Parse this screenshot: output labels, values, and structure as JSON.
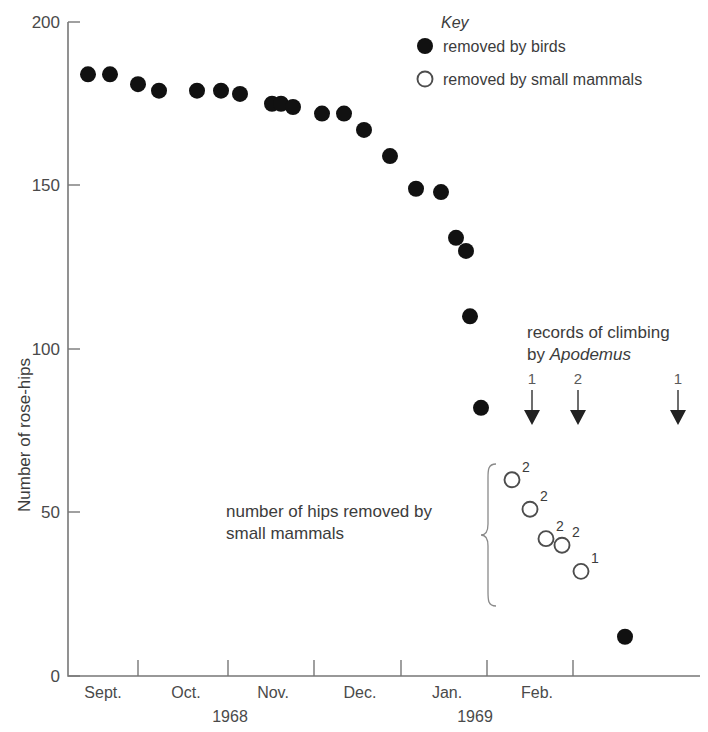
{
  "chart_data": {
    "type": "scatter",
    "title": "",
    "xlabel": "",
    "ylabel": "Number of rose-hips",
    "ylim": [
      0,
      200
    ],
    "yticks": [
      0,
      50,
      100,
      150,
      200
    ],
    "ytick_labels": [
      "0",
      "50",
      "100",
      "150",
      "200"
    ],
    "grid": false,
    "xtick_month_labels": [
      "Sept.",
      "Oct.",
      "Nov.",
      "Dec.",
      "Jan.",
      "Feb."
    ],
    "x_year_labels": [
      "1968",
      "1969"
    ],
    "legend_position": "top-right",
    "series": [
      {
        "name": "removed by birds",
        "marker": "filled-circle",
        "color": "#111111",
        "points": [
          {
            "x_px": 88,
            "value": 184
          },
          {
            "x_px": 110,
            "value": 184
          },
          {
            "x_px": 138,
            "value": 181
          },
          {
            "x_px": 159,
            "value": 179
          },
          {
            "x_px": 197,
            "value": 179
          },
          {
            "x_px": 221,
            "value": 179
          },
          {
            "x_px": 240,
            "value": 178
          },
          {
            "x_px": 272,
            "value": 175
          },
          {
            "x_px": 281,
            "value": 175
          },
          {
            "x_px": 293,
            "value": 174
          },
          {
            "x_px": 322,
            "value": 172
          },
          {
            "x_px": 344,
            "value": 172
          },
          {
            "x_px": 364,
            "value": 167
          },
          {
            "x_px": 390,
            "value": 159
          },
          {
            "x_px": 416,
            "value": 149
          },
          {
            "x_px": 441,
            "value": 148
          },
          {
            "x_px": 456,
            "value": 134
          },
          {
            "x_px": 466,
            "value": 130
          },
          {
            "x_px": 470,
            "value": 110
          },
          {
            "x_px": 481,
            "value": 82
          },
          {
            "x_px": 625,
            "value": 12
          }
        ]
      },
      {
        "name": "removed by small mammals",
        "marker": "open-circle",
        "color": "#4d4d4d",
        "points": [
          {
            "x_px": 512,
            "value": 60,
            "label": "2"
          },
          {
            "x_px": 530,
            "value": 51,
            "label": "2"
          },
          {
            "x_px": 546,
            "value": 42,
            "label": "2"
          },
          {
            "x_px": 562,
            "value": 40,
            "label": "2"
          },
          {
            "x_px": 581,
            "value": 32,
            "label": "1"
          }
        ]
      }
    ],
    "annotations": [
      {
        "name": "records-of-climbing",
        "text_line1": "records of climbing",
        "text_line2_prefix": "by ",
        "text_line2_italic": "Apodemus"
      },
      {
        "name": "small-mammals-brace",
        "text_line1": "number of hips removed by",
        "text_line2": "small mammals"
      }
    ],
    "climbing_arrows": [
      {
        "x_px": 532,
        "label": "1"
      },
      {
        "x_px": 578,
        "label": "2"
      },
      {
        "x_px": 678,
        "label": "1"
      }
    ]
  },
  "axes": {
    "y_title": "Number of rose-hips",
    "y_tick_200": "200",
    "y_tick_150": "150",
    "y_tick_100": "100",
    "y_tick_50": "50",
    "y_tick_0": "0",
    "month_sept": "Sept.",
    "month_oct": "Oct.",
    "month_nov": "Nov.",
    "month_dec": "Dec.",
    "month_jan": "Jan.",
    "month_feb": "Feb.",
    "year_1968": "1968",
    "year_1969": "1969"
  },
  "legend": {
    "title": "Key",
    "item_birds": "removed by birds",
    "item_mammals": "removed by small mammals"
  },
  "annotations": {
    "climbing_line1": "records of climbing",
    "climbing_line2_prefix": "by ",
    "climbing_line2_species": "Apodemus",
    "arrow_1_label": "1",
    "arrow_2_label": "2",
    "arrow_3_label": "1",
    "brace_line1": "number of hips removed by",
    "brace_line2": "small mammals"
  },
  "markers": {
    "sup_1": "2",
    "sup_2": "2",
    "sup_3": "2",
    "sup_4": "2",
    "sup_5": "1"
  },
  "colors": {
    "filled_marker": "#111111",
    "open_marker_stroke": "#4d4d4d",
    "axis": "#777777",
    "text": "#3c3c3c"
  }
}
